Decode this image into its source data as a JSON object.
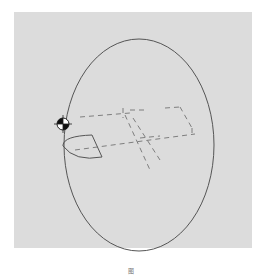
{
  "figure": {
    "background": "#dcdcdc",
    "line_color": "#555555",
    "elements": [
      {
        "type": "ellipse",
        "name": "outer-ellipse",
        "cx": 138,
        "cy": 174,
        "rx": 76,
        "ry": 134
      },
      {
        "type": "target-marker",
        "name": "center-of-gravity-marker",
        "x": 63,
        "y": 121
      },
      {
        "type": "sector",
        "name": "small-sector-shape"
      },
      {
        "type": "dashed-box",
        "name": "dashed-prism"
      }
    ]
  },
  "caption": {
    "text": "图"
  }
}
